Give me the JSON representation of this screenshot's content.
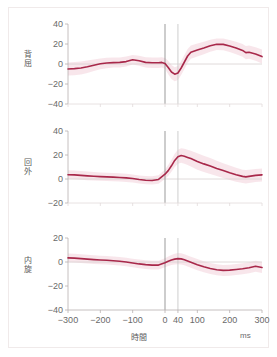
{
  "figure": {
    "background": "#ffffff",
    "frame_color": "#f0eaea",
    "line_color": "#a8२a4a",
    "xaxis_label": "時間",
    "xaxis_unit": "ms"
  },
  "chart_data": {
    "type": "line",
    "title": "",
    "xlabel": "時間",
    "xunit": "ms",
    "ylabel": "",
    "xlim": [
      -300,
      300
    ],
    "xticks": [
      -300,
      -200,
      -100,
      0,
      40,
      100,
      200,
      300
    ],
    "xticklabels": [
      "−300",
      "−200",
      "−100",
      "0",
      "40",
      "100",
      "200",
      "300"
    ],
    "grid": false,
    "legend": "none",
    "line_color": "#a8284a",
    "band_color": "#f0c8d2",
    "zero_line_color": "#d8d0d0",
    "marker_lines": [
      {
        "x": 0,
        "color": "#909090"
      },
      {
        "x": 40,
        "color": "#c8c8c8"
      }
    ],
    "panels": [
      {
        "name": "背屈",
        "ylim": [
          -40,
          40
        ],
        "yticks": [
          -40,
          -20,
          0,
          20,
          40
        ],
        "yticklabels": [
          "−40",
          "−20",
          "0",
          "20",
          "40"
        ],
        "x": [
          -300,
          -280,
          -260,
          -240,
          -220,
          -200,
          -180,
          -160,
          -140,
          -120,
          -100,
          -80,
          -60,
          -40,
          -20,
          -10,
          0,
          10,
          20,
          30,
          40,
          50,
          60,
          70,
          80,
          100,
          120,
          140,
          160,
          180,
          200,
          220,
          240,
          250,
          260,
          280,
          300
        ],
        "y": [
          -5.0,
          -4.6,
          -4.0,
          -2.8,
          -1.2,
          0.2,
          1.0,
          1.4,
          1.6,
          2.4,
          4.2,
          3.2,
          1.6,
          1.2,
          1.2,
          1.6,
          0.6,
          -3.5,
          -8.0,
          -10.2,
          -9.0,
          -4.0,
          2.0,
          8.0,
          11.8,
          14.0,
          16.0,
          18.2,
          19.8,
          19.6,
          18.0,
          16.0,
          13.6,
          11.4,
          11.8,
          10.0,
          7.4
        ],
        "band_upper": [
          1.5,
          2.0,
          2.4,
          3.4,
          4.6,
          5.6,
          6.2,
          6.4,
          6.6,
          7.4,
          9.0,
          8.2,
          6.8,
          6.4,
          6.4,
          6.8,
          6.0,
          3.2,
          -1.0,
          -3.2,
          -2.0,
          3.0,
          9.0,
          15.0,
          18.4,
          20.4,
          22.2,
          24.2,
          25.6,
          25.4,
          24.0,
          22.2,
          20.0,
          18.0,
          18.4,
          16.8,
          14.4
        ],
        "band_lower": [
          -11.5,
          -11.2,
          -10.4,
          -9.0,
          -7.0,
          -5.2,
          -4.2,
          -3.6,
          -3.4,
          -2.6,
          -0.6,
          -1.8,
          -3.6,
          -4.0,
          -4.0,
          -3.6,
          -4.8,
          -10.2,
          -15.0,
          -17.2,
          -16.0,
          -11.0,
          -5.0,
          1.0,
          5.2,
          7.6,
          9.8,
          12.2,
          14.0,
          13.8,
          12.0,
          9.8,
          7.2,
          4.8,
          5.2,
          3.2,
          0.4
        ]
      },
      {
        "name": "回外",
        "ylim": [
          -20,
          40
        ],
        "yticks": [
          -20,
          0,
          20,
          40
        ],
        "yticklabels": [
          "−20",
          "0",
          "20",
          "40"
        ],
        "x": [
          -300,
          -280,
          -260,
          -240,
          -220,
          -200,
          -180,
          -160,
          -140,
          -120,
          -100,
          -80,
          -60,
          -40,
          -20,
          0,
          10,
          20,
          30,
          40,
          50,
          60,
          70,
          80,
          100,
          120,
          140,
          160,
          180,
          200,
          220,
          240,
          250,
          260,
          280,
          300
        ],
        "y": [
          3.6,
          3.4,
          3.0,
          2.6,
          2.3,
          2.0,
          1.8,
          1.6,
          1.3,
          0.9,
          0.4,
          -0.4,
          -1.0,
          -1.2,
          -0.4,
          4.0,
          7.0,
          11.0,
          15.5,
          18.6,
          19.6,
          19.0,
          18.0,
          17.0,
          14.6,
          12.6,
          10.8,
          8.8,
          7.0,
          5.2,
          3.6,
          2.2,
          1.8,
          2.2,
          3.0,
          3.4
        ],
        "band_upper": [
          7.2,
          7.0,
          6.6,
          6.2,
          5.8,
          5.4,
          5.2,
          5.0,
          4.7,
          4.3,
          3.8,
          3.0,
          2.4,
          2.2,
          3.2,
          8.0,
          11.6,
          16.0,
          21.0,
          24.4,
          25.6,
          25.2,
          24.4,
          23.6,
          21.4,
          19.4,
          17.4,
          15.2,
          13.2,
          11.2,
          9.4,
          7.8,
          7.4,
          7.8,
          8.4,
          8.8
        ],
        "band_lower": [
          0.0,
          -0.2,
          -0.6,
          -1.0,
          -1.2,
          -1.4,
          -1.6,
          -1.8,
          -2.1,
          -2.5,
          -3.0,
          -3.8,
          -4.4,
          -4.6,
          -4.0,
          0.0,
          2.4,
          6.0,
          10.0,
          12.8,
          13.6,
          12.8,
          11.6,
          10.4,
          7.8,
          5.8,
          4.2,
          2.4,
          0.8,
          -0.8,
          -2.2,
          -3.4,
          -3.8,
          -3.4,
          -2.4,
          -2.0
        ]
      },
      {
        "name": "内旋",
        "ylim": [
          -40,
          20
        ],
        "yticks": [
          -40,
          -20,
          0,
          20
        ],
        "yticklabels": [
          "−40",
          "−20",
          "0",
          "20"
        ],
        "x": [
          -300,
          -280,
          -260,
          -240,
          -220,
          -200,
          -180,
          -160,
          -140,
          -120,
          -100,
          -80,
          -60,
          -40,
          -20,
          0,
          10,
          20,
          30,
          40,
          50,
          60,
          70,
          80,
          100,
          120,
          140,
          160,
          180,
          200,
          220,
          240,
          260,
          280,
          300
        ],
        "y": [
          3.4,
          3.2,
          2.8,
          2.4,
          2.0,
          1.7,
          1.4,
          1.1,
          0.6,
          0.0,
          -0.8,
          -1.6,
          -2.2,
          -2.6,
          -2.6,
          -0.6,
          0.6,
          1.6,
          2.4,
          2.8,
          2.6,
          1.8,
          0.8,
          -0.2,
          -2.2,
          -4.0,
          -5.4,
          -6.4,
          -7.0,
          -6.8,
          -6.2,
          -5.6,
          -4.8,
          -3.6,
          -4.6
        ],
        "band_upper": [
          7.0,
          6.8,
          6.4,
          6.0,
          5.6,
          5.2,
          4.9,
          4.6,
          4.2,
          3.6,
          2.8,
          2.0,
          1.4,
          1.0,
          1.0,
          3.2,
          4.6,
          5.8,
          6.8,
          7.4,
          7.2,
          6.4,
          5.4,
          4.4,
          2.4,
          0.6,
          -0.8,
          -1.8,
          -2.4,
          -2.2,
          -1.6,
          -1.0,
          -0.2,
          1.0,
          0.0
        ],
        "band_lower": [
          -0.2,
          -0.4,
          -0.8,
          -1.2,
          -1.6,
          -1.8,
          -2.1,
          -2.4,
          -3.0,
          -3.6,
          -4.4,
          -5.2,
          -5.8,
          -6.2,
          -6.2,
          -4.4,
          -3.4,
          -2.6,
          -2.0,
          -1.8,
          -2.0,
          -2.8,
          -3.8,
          -4.8,
          -6.8,
          -8.6,
          -10.0,
          -11.0,
          -11.6,
          -11.4,
          -10.8,
          -10.2,
          -9.4,
          -8.2,
          -9.2
        ]
      }
    ]
  }
}
